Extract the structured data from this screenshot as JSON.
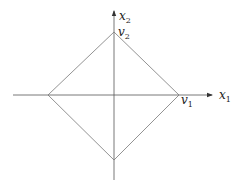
{
  "diagram": {
    "type": "rhombus-on-axes",
    "axes": {
      "x_label": "x",
      "x_sub": "1",
      "y_label": "x",
      "y_sub": "2"
    },
    "vertices": {
      "v1_label": "v",
      "v1_sub": "1",
      "v2_label": "v",
      "v2_sub": "2"
    },
    "colors": {
      "axis": "#555555",
      "shape": "#777777",
      "text": "#222222"
    }
  }
}
